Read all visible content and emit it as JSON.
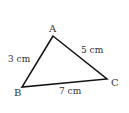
{
  "diagram": {
    "type": "triangle",
    "colors": {
      "background": "#ffffff",
      "stroke": "#111111",
      "text": "#333333"
    },
    "vertices": [
      {
        "id": "A",
        "label": "A",
        "x": 53,
        "y": 36
      },
      {
        "id": "B",
        "label": "B",
        "x": 22,
        "y": 87
      },
      {
        "id": "C",
        "label": "C",
        "x": 107,
        "y": 79
      }
    ],
    "sides": [
      {
        "between": "AB",
        "label": "3 cm"
      },
      {
        "between": "AC",
        "label": "5 cm"
      },
      {
        "between": "BC",
        "label": "7 cm"
      }
    ]
  }
}
